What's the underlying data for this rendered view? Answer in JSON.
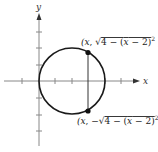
{
  "diagram": {
    "type": "circle-graph",
    "axes": {
      "x_label": "x",
      "y_label": "y",
      "tick_count_x": 6,
      "tick_count_y": 6
    },
    "circle": {
      "center": [
        2,
        0
      ],
      "radius": 2,
      "equation": "(x - 2)^2 + y^2 = 4"
    },
    "chord_x": 3,
    "points": {
      "upper": {
        "label": "(x, √4 − (x − 2)² )"
      },
      "lower": {
        "label": "(x, −√4 − (x − 2)² )"
      }
    },
    "colors": {
      "axis": "#777777",
      "curve": "#1a1a1a",
      "text": "#222222"
    }
  }
}
